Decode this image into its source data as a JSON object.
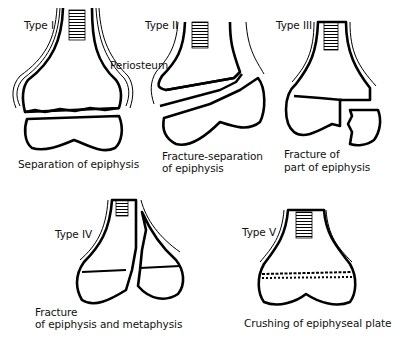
{
  "figure": {
    "panels": [
      {
        "type": "Type I",
        "caption_lines": [
          "Separation of epiphysis"
        ],
        "annotation": "Periosteum"
      },
      {
        "type": "Type II",
        "caption_lines": [
          "Fracture-separation",
          "of epiphysis"
        ]
      },
      {
        "type": "Type III",
        "caption_lines": [
          "Fracture of",
          "part of epiphysis"
        ]
      },
      {
        "type": "Type IV",
        "caption_lines": [
          "Fracture",
          "of epiphysis and metaphysis"
        ]
      },
      {
        "type": "Type V",
        "caption_lines": [
          "Crushing of epiphyseal plate"
        ]
      }
    ]
  },
  "colors": {
    "ink": "#000000",
    "background": "#ffffff"
  }
}
